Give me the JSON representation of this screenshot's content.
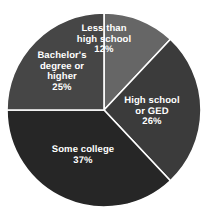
{
  "chart_data": {
    "type": "pie",
    "title": "",
    "subtitle": "",
    "xlabel": "",
    "ylabel": "",
    "legend_position": "none",
    "grid": false,
    "labels_on_slices": true,
    "categories": [
      "Less than high school",
      "High school or GED",
      "Some college",
      "Bachelor's degree or higher"
    ],
    "values": [
      12,
      26,
      37,
      25
    ],
    "value_unit": "%",
    "slices": [
      {
        "label": "Less than high school",
        "label_line1": "Less than",
        "label_line2": "high school",
        "value": 12,
        "value_text": "12%",
        "color": "#666666",
        "start_angle_deg": 0,
        "end_angle_deg": 43.2
      },
      {
        "label": "High school or GED",
        "label_line1": "High school",
        "label_line2": "or GED",
        "value": 26,
        "value_text": "26%",
        "color": "#3b3b3b",
        "start_angle_deg": 43.2,
        "end_angle_deg": 136.8
      },
      {
        "label": "Some college",
        "label_line1": "Some college",
        "label_line2": "",
        "value": 37,
        "value_text": "37%",
        "color": "#262626",
        "start_angle_deg": 136.8,
        "end_angle_deg": 270.0
      },
      {
        "label": "Bachelor's degree or higher",
        "label_line1": "Bachelor's",
        "label_line2": "degree or",
        "label_line3": "higher",
        "value": 25,
        "value_text": "25%",
        "color": "#464646",
        "start_angle_deg": 270.0,
        "end_angle_deg": 360.0
      }
    ],
    "geometry": {
      "center_x": 104,
      "center_y": 110,
      "radius": 97
    },
    "style": {
      "background_color": "#ffffff",
      "separator_color": "#ffffff",
      "label_text_color": "#ffffff"
    }
  }
}
